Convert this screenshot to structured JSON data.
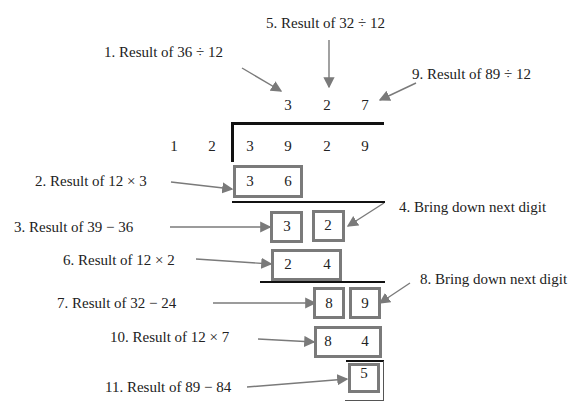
{
  "labels": {
    "step1": "1. Result of 36 ÷ 12",
    "step2": "2. Result of 12 × 3",
    "step3": "3. Result of 39 − 36",
    "step4": "4. Bring down next digit",
    "step5": "5. Result of 32 ÷ 12",
    "step6": "6. Result of 12 × 2",
    "step7": "7. Result of 32 − 24",
    "step8": "8. Bring down next digit",
    "step9": "9. Result of 89 ÷ 12",
    "step10": "10. Result of 12 × 7",
    "step11": "11. Result of 89 − 84"
  },
  "quotient": [
    "3",
    "2",
    "7"
  ],
  "divisor": [
    "1",
    "2"
  ],
  "dividend": [
    "3",
    "9",
    "2",
    "9"
  ],
  "rows": {
    "product1": [
      "3",
      "6"
    ],
    "remainder1": [
      "3"
    ],
    "broughtDown1": [
      "2"
    ],
    "product2": [
      "2",
      "4"
    ],
    "remainder2": [
      "8"
    ],
    "broughtDown2": [
      "9"
    ],
    "product3": [
      "8",
      "4"
    ],
    "finalRemainder": "5"
  },
  "colors": {
    "box": "#7a7a7a",
    "arrow": "#7a7a7a",
    "bar": "#111111"
  }
}
